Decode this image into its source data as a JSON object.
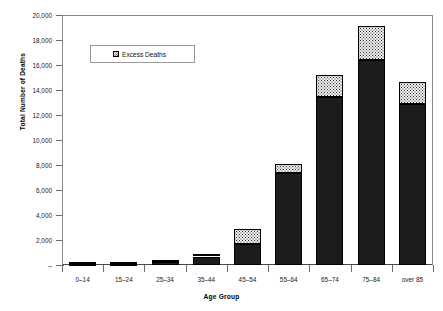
{
  "chart_data": {
    "type": "bar",
    "stacked": true,
    "title": "",
    "xlabel": "Age Group",
    "ylabel": "Total Number of Deaths",
    "categories": [
      "0–14",
      "15–24",
      "25–34",
      "35–44",
      "45–54",
      "55–64",
      "65–74",
      "75–84",
      "over 85"
    ],
    "series": [
      {
        "name": "Baseline Deaths",
        "values": [
          20,
          40,
          250,
          680,
          1700,
          7400,
          13450,
          16400,
          12850
        ]
      },
      {
        "name": "Excess Deaths",
        "values": [
          10,
          15,
          30,
          100,
          1150,
          650,
          1750,
          2700,
          1800
        ]
      }
    ],
    "totals": [
      30,
      55,
      280,
      780,
      2850,
      8050,
      15200,
      19100,
      14650
    ],
    "ylim": [
      0,
      20000
    ],
    "ytick_values": [
      0,
      2000,
      4000,
      6000,
      8000,
      10000,
      12000,
      14000,
      16000,
      18000,
      20000
    ],
    "ytick_labels": [
      "–",
      "2,000",
      "4,000",
      "6,000",
      "8,000",
      "10,000",
      "12,000",
      "14,000",
      "16,000",
      "18,000",
      "20,000"
    ],
    "grid": false,
    "legend_position": "upper-left-inside",
    "legend_entries": [
      {
        "label": "Excess Deaths",
        "swatch": "checkered-dotted-pattern"
      }
    ],
    "colors": {
      "baseline": "#1c1c1c",
      "excess_fill": "#f2f2f2",
      "excess_dots": "#2a2a2a",
      "axis": "#6a6a6a",
      "frame": "#8a8a8a",
      "text": "#1a1a1a"
    }
  },
  "axis": {
    "x_title": "Age Group",
    "y_title": "Total Number of Deaths"
  },
  "legend": {
    "items": [
      {
        "label": "Excess Deaths"
      }
    ]
  }
}
